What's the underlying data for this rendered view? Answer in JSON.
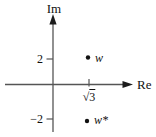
{
  "figure": {
    "type": "complex-plane-diagram",
    "axes": {
      "vertical_label": "Im",
      "horizontal_label": "Re"
    },
    "ticks": {
      "im_positive": "2",
      "im_negative": "−2",
      "re_radical": "√",
      "re_radicand": "3",
      "re_value": "√3"
    },
    "points": [
      {
        "label": "w",
        "re": "√3",
        "im": 2
      },
      {
        "label": "w*",
        "re": "√3",
        "im": -2
      }
    ],
    "colors": {
      "background": "#ffffff",
      "line": "#555555",
      "arrow": "#1c1c1c",
      "text": "#111111",
      "point": "#111111"
    }
  }
}
